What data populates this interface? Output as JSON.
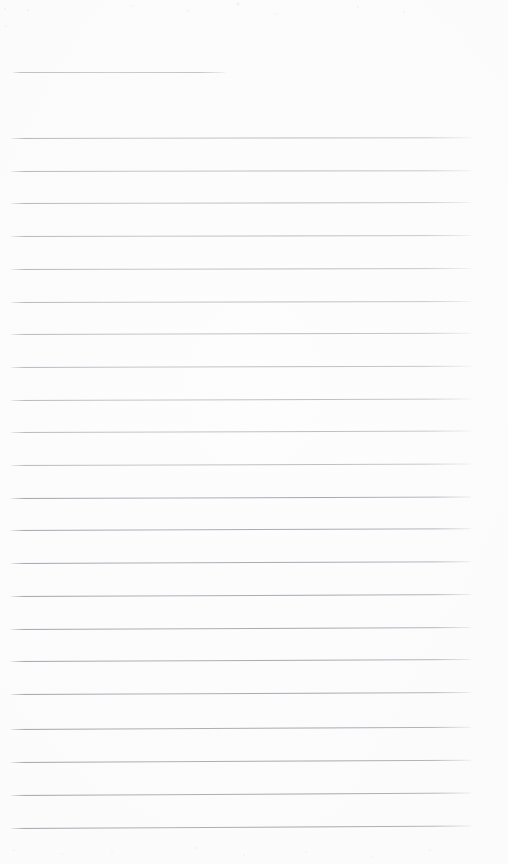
{
  "document": {
    "type": "scanned-lined-paper",
    "title": "",
    "page_width": 508,
    "page_height": 864,
    "background_color": "#fdfdfd",
    "rule_color": "#b6b6bd",
    "handwriting_present": false,
    "text_content": "",
    "notes": "Blank ruled notebook page scan; no text, headings, numbers or marks are present."
  },
  "title_rule": {
    "label": "title-rule",
    "x": 13,
    "y": 72,
    "width": 212
  },
  "body_rules": {
    "label": "body-rule",
    "x": 11,
    "width": 460,
    "count": 22,
    "first_y": 138,
    "spacing": 32.7,
    "lines": [
      {
        "y": 138,
        "slant": -0.1,
        "crisp": false
      },
      {
        "y": 170.7,
        "slant": -0.1,
        "crisp": false
      },
      {
        "y": 203.4,
        "slant": -0.12,
        "crisp": false
      },
      {
        "y": 236.1,
        "slant": -0.12,
        "crisp": false
      },
      {
        "y": 268.8,
        "slant": -0.14,
        "crisp": false
      },
      {
        "y": 301.5,
        "slant": -0.14,
        "crisp": false
      },
      {
        "y": 334.2,
        "slant": -0.16,
        "crisp": false
      },
      {
        "y": 366.9,
        "slant": -0.16,
        "crisp": false
      },
      {
        "y": 399.6,
        "slant": -0.18,
        "crisp": false
      },
      {
        "y": 432.3,
        "slant": -0.18,
        "crisp": false
      },
      {
        "y": 465.0,
        "slant": -0.2,
        "crisp": false
      },
      {
        "y": 497.7,
        "slant": -0.2,
        "crisp": true
      },
      {
        "y": 530.4,
        "slant": -0.22,
        "crisp": true
      },
      {
        "y": 563.1,
        "slant": -0.22,
        "crisp": true
      },
      {
        "y": 595.8,
        "slant": -0.24,
        "crisp": true
      },
      {
        "y": 628.5,
        "slant": -0.24,
        "crisp": true
      },
      {
        "y": 661.2,
        "slant": -0.26,
        "crisp": true
      },
      {
        "y": 693.9,
        "slant": -0.26,
        "crisp": true
      },
      {
        "y": 729.0,
        "slant": -0.28,
        "crisp": true
      },
      {
        "y": 762.0,
        "slant": -0.28,
        "crisp": true
      },
      {
        "y": 795.0,
        "slant": -0.3,
        "crisp": true
      },
      {
        "y": 828.0,
        "slant": -0.3,
        "crisp": true
      }
    ]
  }
}
